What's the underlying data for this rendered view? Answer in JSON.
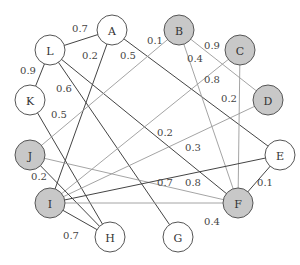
{
  "diagram": {
    "type": "weighted-graph",
    "colors": {
      "shaded": "#c8c8c8",
      "white": "#ffffff",
      "stroke": "#555555",
      "dark_edge": "#444444",
      "light_edge": "#9a9a9a"
    },
    "nodes": [
      {
        "id": "A",
        "x": 112,
        "y": 30,
        "shaded": false
      },
      {
        "id": "B",
        "x": 179,
        "y": 30,
        "shaded": true
      },
      {
        "id": "C",
        "x": 240,
        "y": 50,
        "shaded": true
      },
      {
        "id": "D",
        "x": 268,
        "y": 100,
        "shaded": true
      },
      {
        "id": "E",
        "x": 280,
        "y": 155,
        "shaded": false
      },
      {
        "id": "F",
        "x": 238,
        "y": 203,
        "shaded": true
      },
      {
        "id": "G",
        "x": 178,
        "y": 237,
        "shaded": false
      },
      {
        "id": "H",
        "x": 110,
        "y": 237,
        "shaded": false
      },
      {
        "id": "I",
        "x": 50,
        "y": 203,
        "shaded": true
      },
      {
        "id": "J",
        "x": 30,
        "y": 155,
        "shaded": true
      },
      {
        "id": "K",
        "x": 30,
        "y": 100,
        "shaded": false
      },
      {
        "id": "L",
        "x": 50,
        "y": 50,
        "shaded": false
      }
    ],
    "edges": [
      {
        "from": "L",
        "to": "A",
        "weight": "0.7",
        "dark": true,
        "lx": 80,
        "ly": 28
      },
      {
        "from": "A",
        "to": "I",
        "weight": "0.2",
        "dark": true,
        "lx": 90,
        "ly": 55
      },
      {
        "from": "A",
        "to": "E",
        "weight": "0.5",
        "dark": true,
        "lx": 128,
        "ly": 55
      },
      {
        "from": "L",
        "to": "K",
        "weight": "0.9",
        "dark": true,
        "lx": 28,
        "ly": 70
      },
      {
        "from": "L",
        "to": "G",
        "weight": "0.6",
        "dark": true,
        "lx": 64,
        "ly": 88
      },
      {
        "from": "L",
        "to": "F",
        "weight": "0.2",
        "dark": true,
        "lx": 165,
        "ly": 132
      },
      {
        "from": "K",
        "to": "H",
        "weight": "0.5",
        "dark": true,
        "lx": 59,
        "ly": 114
      },
      {
        "from": "B",
        "to": "J",
        "weight": "0.1",
        "dark": false,
        "lx": 155,
        "ly": 40
      },
      {
        "from": "B",
        "to": "F",
        "weight": "0.4",
        "dark": false,
        "lx": 195,
        "ly": 58
      },
      {
        "from": "B",
        "to": "D",
        "weight": "0.9",
        "dark": false,
        "lx": 212,
        "ly": 45
      },
      {
        "from": "C",
        "to": "I",
        "weight": "0.8",
        "dark": false,
        "lx": 212,
        "ly": 79
      },
      {
        "from": "C",
        "to": "F",
        "weight": "0.2",
        "dark": false,
        "lx": 229,
        "ly": 98
      },
      {
        "from": "D",
        "to": "I",
        "weight": "0.3",
        "dark": false,
        "lx": 193,
        "ly": 147
      },
      {
        "from": "J",
        "to": "F",
        "weight": "0.7",
        "dark": false,
        "lx": 165,
        "ly": 182
      },
      {
        "from": "I",
        "to": "E",
        "weight": "0.8",
        "dark": true,
        "lx": 193,
        "ly": 182
      },
      {
        "from": "J",
        "to": "H",
        "weight": "0.2",
        "dark": true,
        "lx": 39,
        "ly": 176
      },
      {
        "from": "I",
        "to": "H",
        "weight": "0.7",
        "dark": true,
        "lx": 71,
        "ly": 235
      },
      {
        "from": "E",
        "to": "F",
        "weight": "0.1",
        "dark": true,
        "lx": 265,
        "ly": 182
      },
      {
        "from": "I",
        "to": "F",
        "weight": "0.4",
        "dark": false,
        "lx": 212,
        "ly": 221
      }
    ]
  }
}
